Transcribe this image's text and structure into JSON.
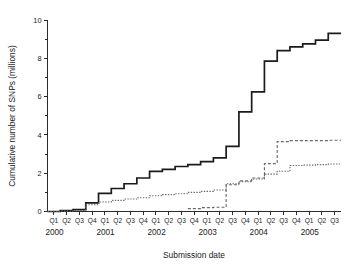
{
  "chart_data": {
    "type": "line",
    "title": "",
    "xlabel": "Submission date",
    "ylabel": "Cumulative number of SNPs (millions)",
    "ylim": [
      0,
      10
    ],
    "yticks": [
      0,
      2,
      4,
      6,
      8,
      10
    ],
    "yticklabels": [
      "0",
      "2",
      "4",
      "6",
      "8",
      "10"
    ],
    "minor_yticks": [
      1,
      3,
      5,
      7,
      9
    ],
    "grid": false,
    "legend": "none",
    "step_style": "post",
    "x": [
      "2000 Q1",
      "2000 Q2",
      "2000 Q3",
      "2000 Q4",
      "2001 Q1",
      "2001 Q2",
      "2001 Q3",
      "2001 Q4",
      "2002 Q1",
      "2002 Q2",
      "2002 Q3",
      "2002 Q4",
      "2003 Q1",
      "2003 Q2",
      "2003 Q3",
      "2003 Q4",
      "2004 Q1",
      "2004 Q2",
      "2004 Q3",
      "2004 Q4",
      "2005 Q1",
      "2005 Q2",
      "2005 Q3"
    ],
    "quarter_labels": [
      "Q1",
      "Q2",
      "Q3",
      "Q4",
      "Q1",
      "Q2",
      "Q3",
      "Q4",
      "Q1",
      "Q2",
      "Q3",
      "Q4",
      "Q1",
      "Q2",
      "Q3",
      "Q4",
      "Q1",
      "Q2",
      "Q3",
      "Q4",
      "Q1",
      "Q2",
      "Q3"
    ],
    "year_labels": [
      "2000",
      "2001",
      "2002",
      "2003",
      "2004",
      "2005"
    ],
    "year_start_index": [
      0,
      4,
      8,
      12,
      16,
      20
    ],
    "series": [
      {
        "name": "Total SNPs",
        "style": "solid",
        "color": "#1b1b1b",
        "values": [
          0.0,
          0.05,
          0.1,
          0.45,
          0.95,
          1.2,
          1.45,
          1.75,
          2.1,
          2.2,
          2.35,
          2.45,
          2.6,
          2.8,
          3.4,
          5.2,
          6.25,
          7.85,
          8.4,
          8.6,
          8.75,
          8.95,
          9.3
        ]
      },
      {
        "name": "Validated SNPs",
        "style": "dotted",
        "color": "#6a6a6a",
        "values": [
          0.0,
          0.02,
          0.05,
          0.35,
          0.5,
          0.58,
          0.65,
          0.72,
          0.82,
          0.88,
          0.93,
          1.0,
          1.05,
          1.12,
          1.45,
          1.55,
          1.7,
          1.95,
          2.1,
          2.4,
          2.42,
          2.45,
          2.48
        ]
      },
      {
        "name": "SNPs with genotype data",
        "style": "dashed",
        "color": "#6a6a6a",
        "values": [
          null,
          null,
          null,
          null,
          null,
          null,
          null,
          null,
          null,
          null,
          null,
          0.15,
          0.2,
          0.22,
          1.4,
          1.6,
          1.75,
          2.5,
          3.65,
          3.7,
          3.7,
          3.7,
          3.72
        ]
      }
    ]
  },
  "figure": {
    "background": "#ffffff",
    "axis_color": "#2b2b2b"
  }
}
